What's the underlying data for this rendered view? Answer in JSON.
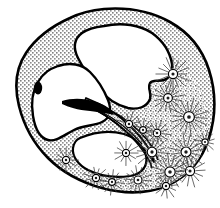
{
  "figure": {
    "title": "Histological cross-section illustration",
    "width": 220,
    "height": 208,
    "background_color": "#ffffff",
    "technique": "ink stipple line drawing"
  },
  "colors": {
    "background": "#ffffff",
    "outline": "#000000",
    "tissue_stipple_light": "#c9c9c9",
    "tissue_stipple_dark": "#6e6e6e",
    "cavity_fill": "#ffffff",
    "cell_center": "#1a1a1a",
    "cell_ring": "#ffffff",
    "solid_black": "#000000"
  },
  "structures": [
    {
      "name": "outer-body-wall",
      "label": "Outer body wall",
      "fill": "stipple",
      "outlined": true
    },
    {
      "name": "upper-cavity",
      "label": "Upper lumen / cavity",
      "fill": "#ffffff",
      "outlined": true
    },
    {
      "name": "left-cavity",
      "label": "Left lower cavity",
      "fill": "#ffffff",
      "outlined": true
    },
    {
      "name": "lower-cavity",
      "label": "Lower inner cavity",
      "fill": "#ffffff",
      "outlined": true
    },
    {
      "name": "septum-band",
      "label": "Stippled septum band",
      "fill": "stipple",
      "outlined": true
    },
    {
      "name": "stylet",
      "label": "Black pointed stylet",
      "fill": "#000000",
      "outlined": false
    },
    {
      "name": "nucleus-spot",
      "label": "Dark oval nucleus",
      "fill": "#000000",
      "outlined": false
    },
    {
      "name": "gland-cell-field",
      "label": "Radiating gland cell field",
      "fill": "dense-stipple",
      "outlined": false
    }
  ],
  "gland_cells": [
    {
      "cx": 173,
      "cy": 74,
      "r": 4.6,
      "spokes": 16,
      "spoke_len": 13
    },
    {
      "cx": 168,
      "cy": 98,
      "r": 4.4,
      "spokes": 16,
      "spoke_len": 12
    },
    {
      "cx": 189,
      "cy": 117,
      "r": 5.4,
      "spokes": 18,
      "spoke_len": 14
    },
    {
      "cx": 186,
      "cy": 152,
      "r": 5.0,
      "spokes": 16,
      "spoke_len": 13
    },
    {
      "cx": 190,
      "cy": 171,
      "r": 4.6,
      "spokes": 14,
      "spoke_len": 11
    },
    {
      "cx": 170,
      "cy": 172,
      "r": 5.2,
      "spokes": 16,
      "spoke_len": 13
    },
    {
      "cx": 152,
      "cy": 152,
      "r": 4.8,
      "spokes": 16,
      "spoke_len": 12
    },
    {
      "cx": 157,
      "cy": 133,
      "r": 3.8,
      "spokes": 14,
      "spoke_len": 10
    },
    {
      "cx": 143,
      "cy": 130,
      "r": 3.4,
      "spokes": 12,
      "spoke_len": 9
    },
    {
      "cx": 129,
      "cy": 124,
      "r": 3.6,
      "spokes": 12,
      "spoke_len": 9
    },
    {
      "cx": 126,
      "cy": 153,
      "r": 3.6,
      "spokes": 12,
      "spoke_len": 9
    },
    {
      "cx": 138,
      "cy": 180,
      "r": 4.0,
      "spokes": 14,
      "spoke_len": 10
    },
    {
      "cx": 166,
      "cy": 186,
      "r": 3.6,
      "spokes": 12,
      "spoke_len": 9
    },
    {
      "cx": 112,
      "cy": 182,
      "r": 3.4,
      "spokes": 12,
      "spoke_len": 9
    },
    {
      "cx": 96,
      "cy": 178,
      "r": 3.6,
      "spokes": 12,
      "spoke_len": 9
    },
    {
      "cx": 66,
      "cy": 160,
      "r": 3.6,
      "spokes": 12,
      "spoke_len": 9
    },
    {
      "cx": 205,
      "cy": 142,
      "r": 3.2,
      "spokes": 12,
      "spoke_len": 8
    }
  ],
  "stylet": {
    "label": "stylet",
    "tip_x": 62,
    "tip_y": 101,
    "base_x": 112,
    "base_y": 116
  },
  "nucleus": {
    "label": "nucleus",
    "cx": 38,
    "cy": 88,
    "rx": 4.2,
    "ry": 6.4
  }
}
